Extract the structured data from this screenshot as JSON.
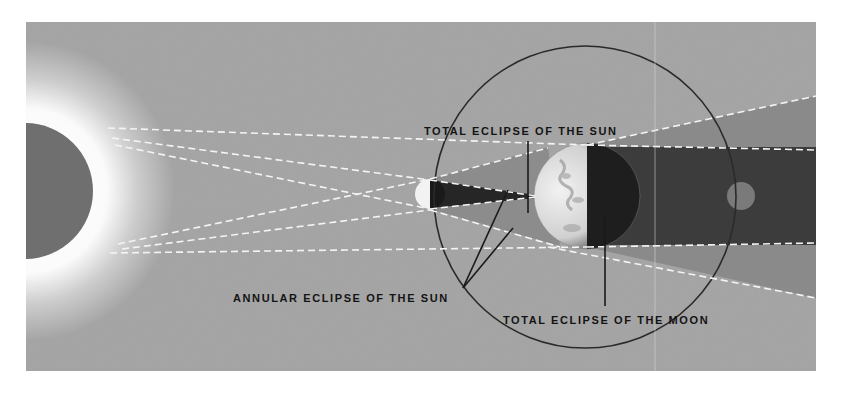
{
  "diagram": {
    "type": "solar and lunar eclipse geometry",
    "bodies": {
      "sun": {
        "name": "Sun",
        "cx": 25,
        "cy": 191,
        "r": 68
      },
      "moon_new": {
        "name": "Moon (between Sun and Earth)",
        "cx": 430,
        "cy": 194,
        "r": 15
      },
      "earth": {
        "name": "Earth",
        "cx": 587,
        "cy": 196,
        "r": 53
      },
      "moon_eclipsed": {
        "name": "Moon (in Earth's shadow)",
        "cx": 741,
        "cy": 196,
        "r": 14
      },
      "moon_orbit": {
        "name": "Moon orbit",
        "cx": 585,
        "cy": 197,
        "r": 151
      }
    },
    "labels": {
      "total_solar": "TOTAL ECLIPSE OF THE SUN",
      "annular_solar": "ANNULAR ECLIPSE OF THE SUN",
      "total_lunar": "TOTAL ECLIPSE OF THE MOON"
    },
    "colors": {
      "page_bg": "#ffffff",
      "panel_bg": "#a2a2a2",
      "sun_disk": "#6f6f6f",
      "corona": "#ffffff",
      "umbra": "#3c3c3c",
      "penumbra": "#8a8a8a",
      "earth_day": "#e4e4e4",
      "earth_night": "#1e1e1e",
      "orbit_line": "#2a2a2a",
      "dash_line": "#f4f4f4",
      "text": "#141414"
    }
  }
}
